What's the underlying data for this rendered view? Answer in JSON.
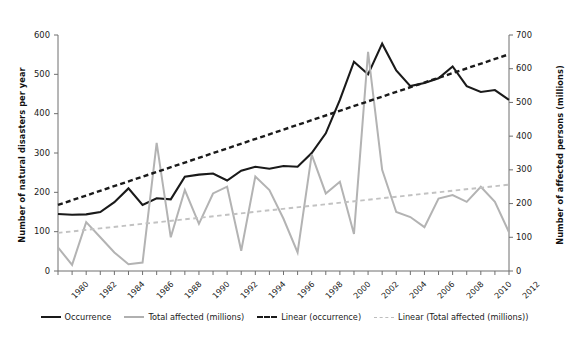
{
  "chart_data": {
    "type": "line",
    "title": "",
    "xlabel": "",
    "ylabel": "Number of natural disasters per year",
    "ylabel_right": "Number of affected persons (millions)",
    "grid": false,
    "legend_position": "bottom",
    "x": [
      1980,
      1981,
      1982,
      1983,
      1984,
      1985,
      1986,
      1987,
      1988,
      1989,
      1990,
      1991,
      1992,
      1993,
      1994,
      1995,
      1996,
      1997,
      1998,
      1999,
      2000,
      2001,
      2002,
      2003,
      2004,
      2005,
      2006,
      2007,
      2008,
      2009,
      2010,
      2011,
      2012
    ],
    "xticks": [
      "1980",
      "1982",
      "1984",
      "1986",
      "1988",
      "1990",
      "1992",
      "1994",
      "1996",
      "1998",
      "2000",
      "2002",
      "2004",
      "2006",
      "2008",
      "2010",
      "2012"
    ],
    "ylim": [
      0,
      600
    ],
    "yticks": [
      0,
      100,
      200,
      300,
      400,
      500,
      600
    ],
    "ylim_right": [
      0,
      700
    ],
    "yticks_right": [
      0,
      100,
      200,
      300,
      400,
      500,
      600,
      700
    ],
    "series": [
      {
        "name": "Occurrence",
        "axis": "left",
        "color": "#1a1a1a",
        "style": "solid",
        "values": [
          145,
          143,
          144,
          150,
          175,
          210,
          168,
          185,
          182,
          240,
          245,
          248,
          230,
          255,
          265,
          260,
          267,
          265,
          300,
          350,
          435,
          532,
          500,
          578,
          510,
          470,
          478,
          490,
          520,
          470,
          455,
          460,
          435
        ]
      },
      {
        "name": "Total affected (millions)",
        "axis": "right",
        "color": "#b3b3b3",
        "style": "solid",
        "values": [
          70,
          18,
          145,
          100,
          55,
          20,
          25,
          380,
          100,
          240,
          140,
          230,
          250,
          60,
          280,
          240,
          155,
          55,
          345,
          230,
          265,
          110,
          650,
          300,
          175,
          160,
          130,
          215,
          225,
          205,
          250,
          205,
          115
        ]
      },
      {
        "name": "Linear (occurrence)",
        "axis": "left",
        "color": "#1a1a1a",
        "style": "dashed",
        "trend": true,
        "endpoints": [
          [
            1980,
            168
          ],
          [
            2012,
            551
          ]
        ]
      },
      {
        "name": "Linear (Total affected (millions))",
        "axis": "right",
        "color": "#c2c2c2",
        "style": "dashed",
        "trend": true,
        "endpoints": [
          [
            1980,
            113
          ],
          [
            2012,
            256
          ]
        ]
      }
    ]
  },
  "axes": {
    "left_title": "Number of natural disasters per year",
    "right_title": "Number of affected persons (millions)",
    "left_ticks": [
      "600",
      "500",
      "400",
      "300",
      "200",
      "100",
      "0"
    ],
    "right_ticks": [
      "700",
      "600",
      "500",
      "400",
      "300",
      "200",
      "100",
      "0"
    ],
    "x_ticks": [
      "1980",
      "1982",
      "1984",
      "1986",
      "1988",
      "1990",
      "1992",
      "1994",
      "1996",
      "1998",
      "2000",
      "2002",
      "2004",
      "2006",
      "2008",
      "2010",
      "2012"
    ]
  },
  "legend": {
    "items": [
      {
        "label": "Occurrence",
        "swatch": "solid-dark-line-icon"
      },
      {
        "label": "Total affected (millions)",
        "swatch": "solid-gray-line-icon"
      },
      {
        "label": "Linear (occurrence)",
        "swatch": "dashed-dark-line-icon"
      },
      {
        "label": "Linear (Total affected (millions))",
        "swatch": "dashed-gray-line-icon"
      }
    ]
  },
  "colors": {
    "occurrence": "#1a1a1a",
    "affected": "#b3b3b3",
    "trend_occurrence": "#1a1a1a",
    "trend_affected": "#c2c2c2",
    "axis": "#6f6f6f",
    "background": "#ffffff"
  }
}
